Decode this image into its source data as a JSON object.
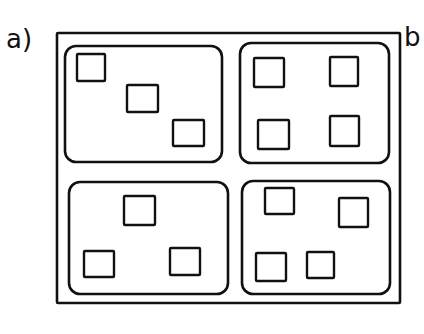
{
  "labels": {
    "a": "a)",
    "b": "b"
  },
  "colors": {
    "stroke": "#111111",
    "background": "#ffffff"
  },
  "diagram": {
    "outer_frame": {
      "x": 57,
      "y": 33,
      "w": 343,
      "h": 270
    },
    "panels": [
      {
        "id": "top-left",
        "x": 65,
        "y": 46,
        "w": 157,
        "h": 116,
        "squares": [
          {
            "x": 77,
            "y": 54,
            "w": 28,
            "h": 27
          },
          {
            "x": 127,
            "y": 85,
            "w": 31,
            "h": 27
          },
          {
            "x": 173,
            "y": 120,
            "w": 31,
            "h": 26
          }
        ]
      },
      {
        "id": "top-right",
        "x": 240,
        "y": 43,
        "w": 149,
        "h": 120,
        "squares": [
          {
            "x": 254,
            "y": 58,
            "w": 30,
            "h": 29
          },
          {
            "x": 330,
            "y": 57,
            "w": 28,
            "h": 29
          },
          {
            "x": 258,
            "y": 120,
            "w": 31,
            "h": 29
          },
          {
            "x": 330,
            "y": 116,
            "w": 29,
            "h": 30
          }
        ]
      },
      {
        "id": "bottom-left",
        "x": 69,
        "y": 182,
        "w": 159,
        "h": 112,
        "squares": [
          {
            "x": 124,
            "y": 196,
            "w": 31,
            "h": 29
          },
          {
            "x": 84,
            "y": 251,
            "w": 30,
            "h": 26
          },
          {
            "x": 170,
            "y": 248,
            "w": 30,
            "h": 27
          }
        ]
      },
      {
        "id": "bottom-right",
        "x": 242,
        "y": 181,
        "w": 148,
        "h": 113,
        "squares": [
          {
            "x": 265,
            "y": 188,
            "w": 29,
            "h": 26
          },
          {
            "x": 339,
            "y": 198,
            "w": 29,
            "h": 29
          },
          {
            "x": 256,
            "y": 253,
            "w": 30,
            "h": 28
          },
          {
            "x": 307,
            "y": 252,
            "w": 27,
            "h": 26
          }
        ]
      }
    ]
  }
}
